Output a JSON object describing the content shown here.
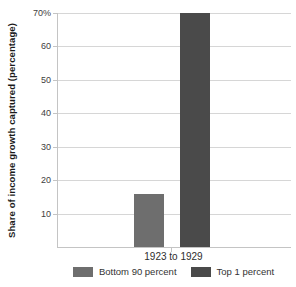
{
  "chart_data": {
    "type": "bar",
    "title": "",
    "categories": [
      "1923 to 1929"
    ],
    "series": [
      {
        "name": "Bottom 90 percent",
        "values": [
          16
        ],
        "color": "#6e6e6e"
      },
      {
        "name": "Top 1 percent",
        "values": [
          70
        ],
        "color": "#4a4a4a"
      }
    ],
    "xlabel": "",
    "ylabel": "Share of income growth captured (percentage)",
    "ylim": [
      0,
      70
    ],
    "yticks": [
      10,
      20,
      30,
      40,
      50,
      60,
      70
    ],
    "ytick_labels": [
      "10",
      "20",
      "30",
      "40",
      "50",
      "60",
      "70%"
    ],
    "grid": true,
    "legend_position": "bottom"
  },
  "colors": {
    "gridline": "#d6d6d6",
    "axis": "#c4c4c4",
    "tick_text": "#404040",
    "background": "#ffffff"
  }
}
